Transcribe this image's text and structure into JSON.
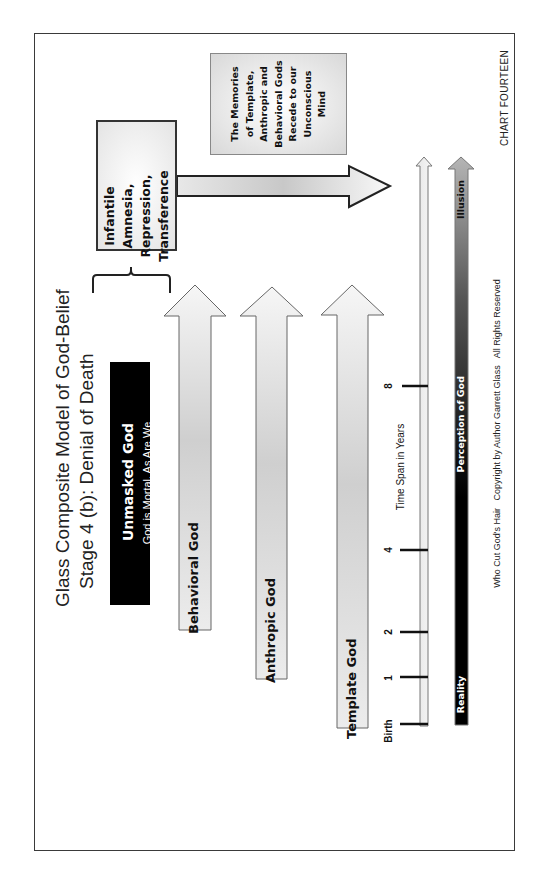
{
  "title": {
    "line1": "Glass Composite Model of God-Belief",
    "line2": "Stage 4 (b): Denial of Death"
  },
  "unmasked": {
    "heading": "Unmasked God",
    "subheading": "God is Mortal, As Are We"
  },
  "infantile_box": {
    "lines": [
      "Infantile",
      "Amnesia,",
      "Repression,",
      "Transference"
    ]
  },
  "memories_box": {
    "lines": [
      "The Memories",
      "of Template,",
      "Anthropic and",
      "Behavioral Gods",
      "Recede to our",
      "Unconscious",
      "Mind"
    ]
  },
  "arrows": [
    {
      "label": "Behavioral God"
    },
    {
      "label": "Anthropic God"
    },
    {
      "label": "Template God"
    }
  ],
  "timeline": {
    "axis_label": "Time Span in Years",
    "ticks": [
      "Birth",
      "1",
      "2",
      "4",
      "8"
    ]
  },
  "perception_bar": {
    "start_label": "Reality",
    "middle_label": "Perception of God",
    "end_label": "Illusion"
  },
  "chart_label": "CHART FOURTEEN",
  "copyright": "Who Cut God's Hair   Copyright by Author Garrett Glass   All Rights Reserved",
  "colors": {
    "frame": "#3a3a3a",
    "black_box": "#000000",
    "arrow_fill_light": "#f4f4f4",
    "arrow_fill_mid": "#cfcfcf"
  }
}
